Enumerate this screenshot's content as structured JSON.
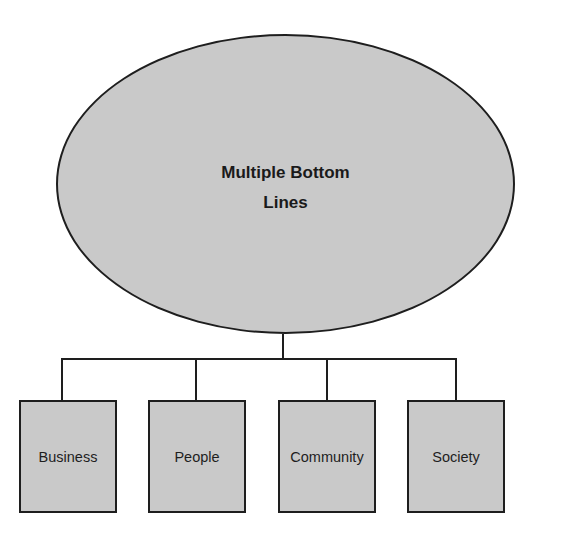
{
  "diagram": {
    "type": "hierarchy",
    "root": {
      "label": "Multiple Bottom Lines",
      "shape": "ellipse"
    },
    "children": [
      {
        "label": "Business",
        "shape": "rectangle"
      },
      {
        "label": "People",
        "shape": "rectangle"
      },
      {
        "label": "Community",
        "shape": "rectangle"
      },
      {
        "label": "Society",
        "shape": "rectangle"
      }
    ],
    "colors": {
      "fill": "#c9c9c9",
      "stroke": "#1e1e1e",
      "text": "#1a1a1a",
      "background": "#ffffff"
    }
  }
}
